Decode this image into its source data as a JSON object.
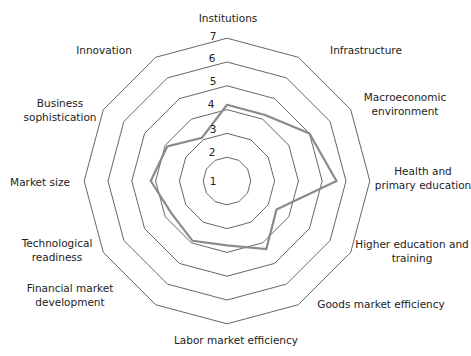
{
  "chart_data": {
    "type": "radar",
    "title": "",
    "categories": [
      "Institutions",
      "Infrastructure",
      "Macroeconomic environment",
      "Health and primary education",
      "Higher education and training",
      "Goods market efficiency",
      "Labor market efficiency",
      "Financial market development",
      "Technological readiness",
      "Market size",
      "Business sophistication",
      "Innovation"
    ],
    "category_display": [
      [
        "Institutions"
      ],
      [
        "Infrastructure"
      ],
      [
        "Macroeconomic",
        "environment"
      ],
      [
        "Health and",
        "primary education"
      ],
      [
        "Higher education and",
        "training"
      ],
      [
        "Goods market efficiency"
      ],
      [
        "Labor market efficiency"
      ],
      [
        "Financial market",
        "development"
      ],
      [
        "Technological",
        "readiness"
      ],
      [
        "Market size"
      ],
      [
        "Business",
        "sophistication"
      ],
      [
        "Innovation"
      ]
    ],
    "series": [
      {
        "name": "Score",
        "values": [
          4.2,
          4.2,
          5.0,
          5.6,
          3.4,
          4.3,
          3.7,
          3.9,
          3.7,
          4.2,
          3.9,
          3.1
        ],
        "color": "#8a8a8a"
      }
    ],
    "rlim": [
      1,
      7
    ],
    "ticks": [
      1,
      2,
      3,
      4,
      5,
      6,
      7
    ],
    "grid": true,
    "grid_color": "#555555",
    "legend": "none"
  }
}
